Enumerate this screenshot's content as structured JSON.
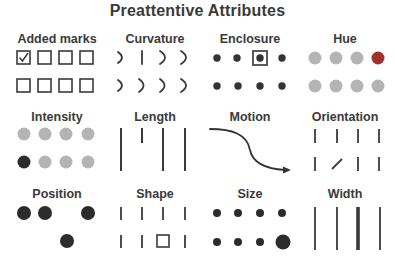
{
  "title": "Preattentive Attributes",
  "colors": {
    "ink": "#333333",
    "gray_dot": "#b4b4b4",
    "accent_red": "#a3312b",
    "background": "#ffffff"
  },
  "panels": [
    {
      "id": "added-marks",
      "label": "Added marks",
      "row1": [
        "checked-box",
        "box",
        "box",
        "box"
      ],
      "row2": [
        "box",
        "box",
        "box",
        "box"
      ]
    },
    {
      "id": "curvature",
      "label": "Curvature",
      "row1": [
        "arc",
        "straight-line",
        "arc",
        "arc"
      ],
      "row2": [
        "arc",
        "arc",
        "arc",
        "arc"
      ]
    },
    {
      "id": "enclosure",
      "label": "Enclosure",
      "row1": [
        "dot",
        "dot",
        "enclosed-dot",
        "dot"
      ],
      "row2": [
        "dot",
        "dot",
        "dot",
        "dot"
      ]
    },
    {
      "id": "hue",
      "label": "Hue",
      "row1": [
        "gray-dot",
        "gray-dot",
        "gray-dot",
        "red-dot"
      ],
      "row2": [
        "gray-dot",
        "gray-dot",
        "gray-dot",
        "gray-dot"
      ]
    },
    {
      "id": "intensity",
      "label": "Intensity",
      "row1": [
        "gray-dot",
        "gray-dot",
        "gray-dot",
        "gray-dot"
      ],
      "row2": [
        "dark-dot",
        "gray-dot",
        "gray-dot",
        "gray-dot"
      ]
    },
    {
      "id": "length",
      "label": "Length",
      "items": [
        "long-line",
        "short-line",
        "long-line",
        "long-line"
      ]
    },
    {
      "id": "motion",
      "label": "Motion",
      "items": [
        "curved-arrow"
      ]
    },
    {
      "id": "orientation",
      "label": "Orientation",
      "row1": [
        "vertical",
        "vertical",
        "vertical",
        "vertical"
      ],
      "row2": [
        "vertical",
        "diagonal",
        "vertical",
        "vertical"
      ]
    },
    {
      "id": "position",
      "label": "Position",
      "row1": [
        "dot",
        "dot",
        "empty",
        "dot"
      ],
      "row2": [
        "empty",
        "empty",
        "dot",
        "empty"
      ]
    },
    {
      "id": "shape",
      "label": "Shape",
      "row1": [
        "line",
        "line",
        "line",
        "line"
      ],
      "row2": [
        "line",
        "line",
        "square",
        "line"
      ]
    },
    {
      "id": "size",
      "label": "Size",
      "row1": [
        "small-dot",
        "small-dot",
        "small-dot",
        "small-dot"
      ],
      "row2": [
        "small-dot",
        "small-dot",
        "small-dot",
        "large-dot"
      ]
    },
    {
      "id": "width",
      "label": "Width",
      "items": [
        "thin-line",
        "thin-line",
        "thick-line",
        "thin-line"
      ]
    }
  ]
}
